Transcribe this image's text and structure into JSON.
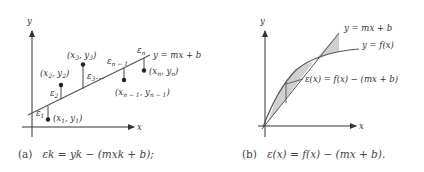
{
  "panel_a": {
    "axis_x_label": "x",
    "axis_y_label": "y",
    "line_label": "y = mx + b",
    "points": [
      {
        "label": "(x1, y1)",
        "error": "ε1"
      },
      {
        "label": "(x2, y2)",
        "error": "ε2"
      },
      {
        "label": "(x3, y3)",
        "error": "ε3"
      },
      {
        "label": "(xn−1, yn−1)",
        "error": "εn−1"
      },
      {
        "label": "(xn, yn)",
        "error": "εn"
      }
    ],
    "ellipsis": "...",
    "caption_tag": "(a)",
    "caption_eq": "εk = yk − (mxk + b);"
  },
  "panel_b": {
    "axis_x_label": "x",
    "axis_y_label": "y",
    "line_label": "y = mx + b",
    "curve_label": "y = f(x)",
    "error_label": "ε(x) = f(x) − (mx + b)",
    "caption_tag": "(b)",
    "caption_eq": "ε(x) = f(x) − (mx + b)."
  },
  "colors": {
    "ink": "#333333",
    "shade": "#cfcfcf"
  }
}
